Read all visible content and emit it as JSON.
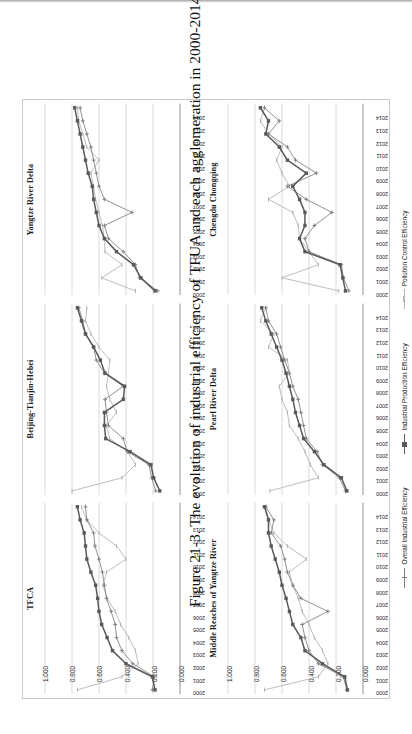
{
  "page": {
    "caption": "Figure 21-3. The evolution of industrial efficiency of TFUA and each agglomeration in 2000-2014."
  },
  "legend": {
    "position": "bottom-center",
    "items": [
      {
        "label": "Overall Industrial Efficiency",
        "color": "#7f7f7f",
        "marker": "plus"
      },
      {
        "label": "Industrial Production Efficiency",
        "color": "#595959",
        "marker": "square"
      },
      {
        "label": "Pollution Control Efficiency",
        "color": "#b3b3b3",
        "marker": "dash"
      }
    ]
  },
  "axis": {
    "y_ticks": [
      "1.000",
      "0.800",
      "0.600",
      "0.400",
      "0.200",
      "0.000"
    ],
    "y_values": [
      1.0,
      0.8,
      0.6,
      0.4,
      0.2,
      0.0
    ],
    "ylim": [
      0,
      1
    ],
    "x_ticks": [
      "2000",
      "2001",
      "2002",
      "2003",
      "2004",
      "2005",
      "2006",
      "2007",
      "2008",
      "2009",
      "2010",
      "2011",
      "2012",
      "2013",
      "2014"
    ]
  },
  "chart_data": {
    "type": "line",
    "title": "Figure 21-3. The evolution of industrial efficiency of TFUA and each agglomeration in 2000-2014.",
    "xlabel": "",
    "ylabel": "",
    "ylim": [
      0,
      1
    ],
    "grid": true,
    "legend": [
      "Overall Industrial Efficiency",
      "Industrial Production Efficiency",
      "Pollution Control Efficiency"
    ],
    "x": [
      "2000",
      "2001",
      "2002",
      "2003",
      "2004",
      "2005",
      "2006",
      "2007",
      "2008",
      "2009",
      "2010",
      "2011",
      "2012",
      "2013",
      "2014"
    ],
    "panels": [
      {
        "name": "TFCA",
        "series": [
          {
            "name": "Overall Industrial Efficiency",
            "color": "#7f7f7f",
            "marker": "plus",
            "values": [
              0.205,
              0.19,
              0.35,
              0.43,
              0.47,
              0.48,
              0.51,
              0.545,
              0.56,
              0.575,
              0.6,
              0.63,
              0.64,
              0.69,
              0.7
            ]
          },
          {
            "name": "Industrial Production Efficiency",
            "color": "#595959",
            "marker": "square",
            "values": [
              0.185,
              0.205,
              0.4,
              0.5,
              0.54,
              0.58,
              0.6,
              0.61,
              0.625,
              0.66,
              0.69,
              0.7,
              0.71,
              0.74,
              0.76
            ]
          },
          {
            "name": "Pollution Control Efficiency",
            "color": "#b3b3b3",
            "marker": "dash",
            "values": [
              0.76,
              0.43,
              0.31,
              0.33,
              0.38,
              0.44,
              0.48,
              0.54,
              0.57,
              0.545,
              0.4,
              0.47,
              0.6,
              0.69,
              0.73
            ]
          }
        ]
      },
      {
        "name": "Beijing-Tianjin-Hebei",
        "series": [
          {
            "name": "Overall Industrial Efficiency",
            "color": "#7f7f7f",
            "marker": "plus",
            "values": [
              0.18,
              0.21,
              0.23,
              0.39,
              0.42,
              0.53,
              0.545,
              0.555,
              0.42,
              0.56,
              0.62,
              0.64,
              0.7,
              0.72,
              0.75
            ]
          },
          {
            "name": "Industrial Production Efficiency",
            "color": "#595959",
            "marker": "square",
            "values": [
              0.15,
              0.195,
              0.215,
              0.37,
              0.55,
              0.56,
              0.56,
              0.42,
              0.41,
              0.555,
              0.59,
              0.64,
              0.7,
              0.73,
              0.76
            ]
          },
          {
            "name": "Pollution Control Efficiency",
            "color": "#b3b3b3",
            "marker": "dash",
            "values": [
              0.8,
              0.43,
              0.33,
              0.39,
              0.52,
              0.545,
              0.47,
              0.52,
              0.545,
              0.53,
              0.52,
              0.6,
              0.66,
              0.7,
              0.69
            ]
          }
        ]
      },
      {
        "name": "Yangtze River Delta",
        "series": [
          {
            "name": "Overall Industrial Efficiency",
            "color": "#7f7f7f",
            "marker": "plus",
            "values": [
              0.165,
              0.3,
              0.33,
              0.42,
              0.53,
              0.56,
              0.355,
              0.56,
              0.6,
              0.62,
              0.64,
              0.66,
              0.69,
              0.72,
              0.74
            ]
          },
          {
            "name": "Industrial Production Efficiency",
            "color": "#595959",
            "marker": "square",
            "values": [
              0.185,
              0.29,
              0.345,
              0.47,
              0.56,
              0.6,
              0.62,
              0.64,
              0.65,
              0.68,
              0.7,
              0.72,
              0.74,
              0.76,
              0.78
            ]
          },
          {
            "name": "Pollution Control Efficiency",
            "color": "#b3b3b3",
            "marker": "dash",
            "values": [
              0.33,
              0.58,
              0.43,
              0.555,
              0.56,
              0.575,
              0.6,
              0.625,
              0.64,
              0.66,
              0.6,
              0.69,
              0.72,
              0.75,
              0.76
            ]
          }
        ]
      },
      {
        "name": "Middle Reaches of Yangtze River",
        "series": [
          {
            "name": "Overall Industrial Efficiency",
            "color": "#7f7f7f",
            "marker": "plus",
            "values": [
              0.12,
              0.145,
              0.33,
              0.4,
              0.43,
              0.45,
              0.26,
              0.46,
              0.52,
              0.56,
              0.58,
              0.61,
              0.68,
              0.66,
              0.72
            ]
          },
          {
            "name": "Industrial Production Efficiency",
            "color": "#595959",
            "marker": "square",
            "values": [
              0.115,
              0.135,
              0.3,
              0.43,
              0.46,
              0.52,
              0.545,
              0.57,
              0.6,
              0.62,
              0.65,
              0.68,
              0.7,
              0.7,
              0.73
            ]
          },
          {
            "name": "Pollution Control Efficiency",
            "color": "#b3b3b3",
            "marker": "dash",
            "values": [
              0.73,
              0.33,
              0.26,
              0.3,
              0.36,
              0.4,
              0.45,
              0.48,
              0.52,
              0.545,
              0.42,
              0.56,
              0.66,
              0.7,
              0.72
            ]
          }
        ]
      },
      {
        "name": "Pearl River Delta",
        "series": [
          {
            "name": "Overall Industrial Efficiency",
            "color": "#7f7f7f",
            "marker": "plus",
            "values": [
              0.13,
              0.175,
              0.3,
              0.34,
              0.42,
              0.44,
              0.46,
              0.48,
              0.52,
              0.545,
              0.58,
              0.61,
              0.64,
              0.7,
              0.72
            ]
          },
          {
            "name": "Industrial Production Efficiency",
            "color": "#595959",
            "marker": "square",
            "values": [
              0.12,
              0.16,
              0.29,
              0.36,
              0.44,
              0.47,
              0.5,
              0.52,
              0.545,
              0.57,
              0.6,
              0.64,
              0.68,
              0.72,
              0.75
            ]
          },
          {
            "name": "Pollution Control Efficiency",
            "color": "#b3b3b3",
            "marker": "dash",
            "values": [
              0.69,
              0.33,
              0.39,
              0.43,
              0.48,
              0.545,
              0.56,
              0.6,
              0.62,
              0.545,
              0.56,
              0.7,
              0.66,
              0.76,
              0.72
            ]
          }
        ]
      },
      {
        "name": "Chengdu Chongqing",
        "series": [
          {
            "name": "Overall Industrial Efficiency",
            "color": "#7f7f7f",
            "marker": "plus",
            "values": [
              0.105,
              0.145,
              0.16,
              0.4,
              0.43,
              0.36,
              0.23,
              0.42,
              0.56,
              0.345,
              0.5,
              0.56,
              0.7,
              0.62,
              0.73
            ]
          },
          {
            "name": "Industrial Production Efficiency",
            "color": "#595959",
            "marker": "square",
            "values": [
              0.13,
              0.15,
              0.17,
              0.43,
              0.47,
              0.43,
              0.43,
              0.47,
              0.52,
              0.42,
              0.56,
              0.62,
              0.72,
              0.7,
              0.76
            ]
          },
          {
            "name": "Pollution Control Efficiency",
            "color": "#b3b3b3",
            "marker": "dash",
            "values": [
              0.18,
              0.6,
              0.33,
              0.4,
              0.47,
              0.48,
              0.52,
              0.7,
              0.545,
              0.6,
              0.64,
              0.6,
              0.7,
              0.76,
              0.73
            ]
          }
        ]
      }
    ]
  }
}
